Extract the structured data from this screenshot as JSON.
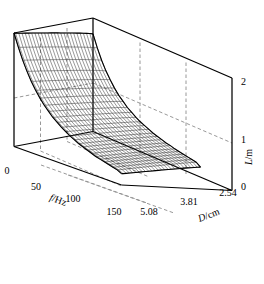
{
  "figure": {
    "type": "surface-plot-3d",
    "background": "#ffffff",
    "line_color": "#000000",
    "grid_color": "#808080"
  },
  "axes": {
    "x": {
      "title": "f/Hz",
      "title_italic_part": "f",
      "title_unit_part": "/Hz",
      "ticks": [
        "0",
        "50",
        "100",
        "150"
      ],
      "values": [
        0,
        50,
        100,
        150
      ],
      "range": [
        0,
        150
      ]
    },
    "y": {
      "title": "D/cm",
      "title_italic_part": "D",
      "title_unit_part": "/cm",
      "ticks": [
        "2.54",
        "3.81",
        "5.08"
      ],
      "values": [
        2.54,
        3.81,
        5.08
      ],
      "range": [
        2.54,
        5.08
      ]
    },
    "z": {
      "title": "L/m",
      "title_italic_part": "L",
      "title_unit_part": "/m",
      "ticks": [
        "0",
        "1",
        "2"
      ],
      "values": [
        0,
        1,
        2
      ],
      "range": [
        0,
        2
      ]
    }
  },
  "chart_data": {
    "type": "surface",
    "title": "",
    "xlabel": "f/Hz",
    "ylabel": "D/cm",
    "zlabel": "L/m",
    "xlim": [
      0,
      150
    ],
    "ylim": [
      2.54,
      5.08
    ],
    "zlim": [
      0,
      2
    ],
    "grid": true,
    "legend": null,
    "x": [
      0,
      6,
      12,
      18,
      24,
      30,
      36,
      42,
      48,
      54,
      60,
      66,
      72,
      78,
      84,
      90,
      96,
      102,
      108,
      114,
      120,
      126,
      132,
      138,
      144,
      150
    ],
    "y": [
      2.54,
      2.644,
      2.748,
      2.851,
      2.955,
      3.059,
      3.163,
      3.267,
      3.37,
      3.474,
      3.578,
      3.682,
      3.786,
      3.889,
      3.993,
      4.097,
      4.201,
      4.305,
      4.408,
      4.512,
      4.616,
      4.72,
      4.824,
      4.927,
      5.031,
      5.08
    ],
    "z_description": "L decreases sharply as f increases and mildly as D increases; ridge of high L (~2 m) along the low-frequency edge, falling to near 0 m at f=150 Hz.",
    "z_corner_values": {
      "f0_D2.54": 1.72,
      "f0_D5.08": 2.0,
      "f150_D2.54": 0.05,
      "f150_D5.08": 0.2
    },
    "z_rows_note": "Each row is one D value (first = 2.54 cm, last = 5.08 cm); each column is one f value from 0 to 150 Hz.",
    "z_profile_low_D": [
      1.72,
      1.5,
      1.31,
      1.15,
      1.02,
      0.9,
      0.8,
      0.72,
      0.64,
      0.58,
      0.52,
      0.47,
      0.43,
      0.39,
      0.35,
      0.32,
      0.29,
      0.26,
      0.24,
      0.21,
      0.19,
      0.17,
      0.15,
      0.13,
      0.11,
      0.05
    ],
    "z_profile_high_D": [
      2.0,
      1.78,
      1.58,
      1.41,
      1.26,
      1.13,
      1.02,
      0.92,
      0.84,
      0.76,
      0.7,
      0.64,
      0.59,
      0.54,
      0.5,
      0.46,
      0.43,
      0.4,
      0.37,
      0.34,
      0.32,
      0.3,
      0.28,
      0.26,
      0.24,
      0.2
    ]
  }
}
